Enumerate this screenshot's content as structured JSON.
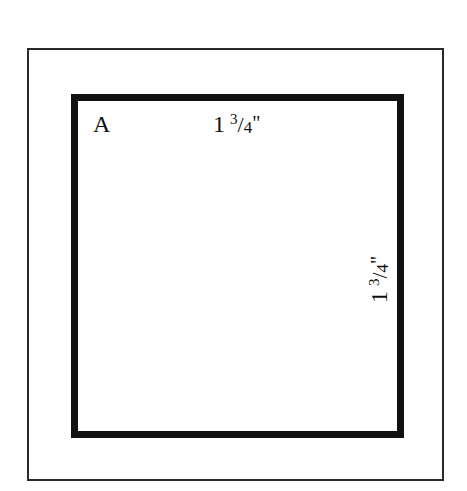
{
  "diagram": {
    "type": "quilt-template",
    "piece_label": "A",
    "dimensions": {
      "width": {
        "whole": "1",
        "numerator": "3",
        "slash": "/",
        "denominator": "4",
        "unit": "\""
      },
      "height": {
        "whole": "1",
        "numerator": "3",
        "slash": "/",
        "denominator": "4",
        "unit": "\""
      }
    },
    "colors": {
      "outline": "#111111",
      "frame": "#2a2a2a",
      "background": "#ffffff"
    }
  }
}
